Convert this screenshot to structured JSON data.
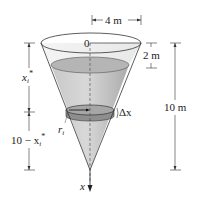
{
  "figure": {
    "type": "conical tank partially filled with water",
    "colors": {
      "water_fill": "#b8b8b8",
      "water_dark": "#9a9a9a",
      "cone_light": "#e6e6e6",
      "slice_fill": "#8c8c8c",
      "line": "#333333"
    },
    "labels": {
      "origin": "0",
      "top_radius": "4 m",
      "empty_depth": "2 m",
      "total_height": "10 m",
      "depth_to_slice": "x",
      "depth_to_slice_sub": "i",
      "depth_to_slice_sup": "*",
      "remaining_prefix": "10 − x",
      "remaining_sub": "i",
      "remaining_sup": "*",
      "slice_thickness": "Δx",
      "slice_radius": "r",
      "slice_radius_sub": "i",
      "axis": "x"
    }
  }
}
